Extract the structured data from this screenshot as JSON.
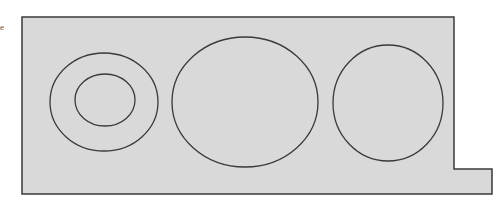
{
  "figure": {
    "background_color": "#ffffff",
    "panel_fill": "#d9d9d9",
    "stroke_color": "#3a3a3a",
    "margin_fragment": "e",
    "panel": {
      "points": "22,17 454,17 454,169 492,169 492,194 22,194"
    },
    "shapes": [
      {
        "name": "outer-ring-left",
        "cx": 104,
        "cy": 102,
        "rx": 54,
        "ry": 49
      },
      {
        "name": "inner-ring-left",
        "cx": 105,
        "cy": 100,
        "rx": 30,
        "ry": 26
      },
      {
        "name": "middle-ellipse",
        "cx": 245,
        "cy": 102,
        "rx": 73,
        "ry": 65
      },
      {
        "name": "right-circle",
        "cx": 388,
        "cy": 103,
        "rx": 55,
        "ry": 58
      }
    ]
  }
}
